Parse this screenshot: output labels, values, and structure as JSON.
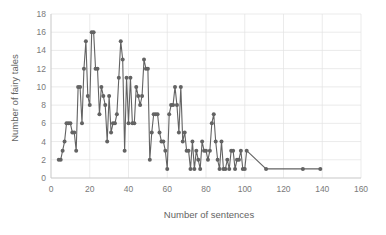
{
  "chart_data": {
    "type": "line",
    "title": "",
    "subtitle": "",
    "xlabel": "Number of sentences",
    "ylabel": "Number of fairy tales",
    "xlim": [
      0,
      160
    ],
    "ylim": [
      0,
      18
    ],
    "xticks": [
      0,
      20,
      40,
      60,
      80,
      100,
      120,
      140,
      160
    ],
    "yticks": [
      0,
      2,
      4,
      6,
      8,
      10,
      12,
      14,
      16,
      18
    ],
    "grid": "horizontal-and-vertical",
    "legend": "none",
    "marker": "circle",
    "series_color": "#636363",
    "gridline_color": "#e2e2e2",
    "tick_label_color": "#7a7a7a",
    "axis_title_color": "#636363",
    "series": [
      {
        "name": "fairy tales per sentence count",
        "x": [
          4,
          5,
          6,
          7,
          8,
          9,
          10,
          11,
          12,
          13,
          14,
          15,
          16,
          17,
          18,
          19,
          20,
          21,
          22,
          23,
          24,
          25,
          26,
          27,
          28,
          29,
          30,
          31,
          32,
          33,
          34,
          35,
          36,
          37,
          38,
          39,
          40,
          41,
          42,
          43,
          44,
          45,
          46,
          47,
          48,
          49,
          50,
          51,
          52,
          53,
          54,
          55,
          56,
          57,
          58,
          59,
          60,
          61,
          62,
          63,
          64,
          65,
          66,
          67,
          68,
          69,
          70,
          71,
          72,
          73,
          74,
          75,
          76,
          77,
          78,
          79,
          80,
          81,
          82,
          83,
          84,
          85,
          86,
          87,
          88,
          89,
          90,
          91,
          92,
          93,
          94,
          95,
          96,
          97,
          98,
          99,
          100,
          101,
          111,
          130,
          139
        ],
        "y": [
          2,
          2,
          3,
          4,
          6,
          6,
          6,
          5,
          5,
          3,
          10,
          10,
          6,
          12,
          15,
          9,
          8,
          16,
          16,
          12,
          12,
          7,
          10,
          9,
          8,
          4,
          9,
          5,
          6,
          6,
          7,
          11,
          15,
          13,
          3,
          11,
          6,
          11,
          6,
          6,
          10,
          9,
          8,
          9,
          13,
          12,
          12,
          2,
          5,
          7,
          7,
          7,
          5,
          4,
          4,
          3,
          1,
          7,
          8,
          8,
          10,
          8,
          5,
          10,
          4,
          5,
          3,
          3,
          1,
          4,
          1,
          3,
          2,
          1,
          4,
          3,
          3,
          2,
          3,
          6,
          7,
          4,
          2,
          1,
          4,
          1,
          1,
          2,
          1,
          3,
          3,
          1,
          2,
          2,
          3,
          1,
          1,
          3,
          1,
          1,
          1
        ]
      }
    ]
  },
  "axes": {
    "x_title": "Number of sentences",
    "y_title": "Number of fairy tales"
  }
}
